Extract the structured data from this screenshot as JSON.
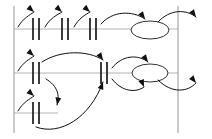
{
  "canvas": {
    "width": 212,
    "height": 139,
    "background": "#ffffff",
    "title": "process-flow-schematic"
  },
  "colors": {
    "rail": "#b4b4b4",
    "boundary": "#a0a0a0",
    "gate": "#1a1a1a",
    "arrow": "#111111",
    "ellipse_stroke": "#333333",
    "ellipse_fill": "#ffffff"
  },
  "strokes": {
    "rail_width": 1.1,
    "boundary_width": 1.1,
    "gate_width": 1.7,
    "arrow_width": 1.0,
    "ellipse_width": 1.0
  },
  "boundaries": [
    {
      "name": "left-boundary",
      "x": 14,
      "y1": 6,
      "y2": 133
    },
    {
      "name": "right-boundary",
      "x": 178,
      "y1": 6,
      "y2": 133
    }
  ],
  "rails": [
    {
      "name": "rail-top",
      "y": 29,
      "x1": 14,
      "x2": 178,
      "label": "row-1"
    },
    {
      "name": "rail-middle",
      "y": 73,
      "x1": 14,
      "x2": 178,
      "label": "row-2"
    },
    {
      "name": "rail-bottom",
      "y": 113,
      "x1": 14,
      "x2": 58,
      "label": "row-3"
    }
  ],
  "gates": [
    {
      "name": "gate-r1-a",
      "x": 33,
      "y": 29,
      "row": 1
    },
    {
      "name": "gate-r1-b",
      "x": 39,
      "y": 29,
      "row": 1
    },
    {
      "name": "gate-r1-c",
      "x": 62,
      "y": 29,
      "row": 1
    },
    {
      "name": "gate-r1-d",
      "x": 68,
      "y": 29,
      "row": 1
    },
    {
      "name": "gate-r1-e",
      "x": 90,
      "y": 29,
      "row": 1
    },
    {
      "name": "gate-r1-f",
      "x": 96,
      "y": 29,
      "row": 1
    },
    {
      "name": "gate-r2-a",
      "x": 33,
      "y": 73,
      "row": 2
    },
    {
      "name": "gate-r2-b",
      "x": 39,
      "y": 73,
      "row": 2
    },
    {
      "name": "gate-r2-c",
      "x": 101,
      "y": 73,
      "row": 2
    },
    {
      "name": "gate-r2-d",
      "x": 107,
      "y": 73,
      "row": 2
    },
    {
      "name": "gate-r3-a",
      "x": 33,
      "y": 113,
      "row": 3
    },
    {
      "name": "gate-r3-b",
      "x": 39,
      "y": 113,
      "row": 3
    }
  ],
  "gate_half_height": 11,
  "nodes": [
    {
      "name": "node-ellipse-top",
      "cx": 150,
      "cy": 30,
      "rx": 19,
      "ry": 9,
      "row": 1
    },
    {
      "name": "node-ellipse-middle",
      "cx": 150,
      "cy": 73,
      "rx": 18,
      "ry": 9,
      "row": 2
    }
  ],
  "arrows": [
    {
      "name": "arc-r1-1",
      "path": "M 18 27 C 23 18, 30 15, 34 12",
      "head": [
        34,
        12,
        0.72
      ]
    },
    {
      "name": "arc-r1-2",
      "path": "M 45 27 C 50 18, 57 15, 62 12",
      "head": [
        62,
        12,
        0.72
      ]
    },
    {
      "name": "arc-r1-3",
      "path": "M 74 27 C 79 18, 85 15, 90 12",
      "head": [
        90,
        12,
        0.72
      ]
    },
    {
      "name": "arc-r1-4",
      "path": "M 101 24 C 112 11, 132 10, 145 19",
      "head": [
        145,
        19,
        0.95
      ]
    },
    {
      "name": "arc-r1-5",
      "path": "M 158 22 C 170 9, 186 9, 196 17",
      "head": [
        196,
        17,
        0.95
      ]
    },
    {
      "name": "arc-r2-1",
      "path": "M 18 71 C 23 62, 30 59, 34 56",
      "head": [
        34,
        56,
        0.72
      ]
    },
    {
      "name": "arc-r2-2",
      "path": "M 42 62 C 60 50, 88 50, 103 60",
      "head": [
        103,
        60,
        0.98
      ]
    },
    {
      "name": "arc-r2-3",
      "path": "M 112 68 C 122 55, 138 54, 148 62",
      "head": [
        148,
        62,
        0.95
      ]
    },
    {
      "name": "arc-r2-4",
      "path": "M 112 79 C 122 92, 136 93, 144 87",
      "head": [
        144,
        87,
        1.18
      ]
    },
    {
      "name": "arc-r2-5",
      "path": "M 158 80 C 172 94, 188 92, 196 83",
      "head": [
        196,
        83,
        0.9
      ]
    },
    {
      "name": "arc-r3-1",
      "path": "M 18 111 C 23 102, 30 99, 34 96",
      "head": [
        34,
        96,
        0.72
      ]
    },
    {
      "name": "arc-down-r2-r3",
      "path": "M 46 79 C 58 86, 60 96, 57 105",
      "head": [
        57,
        105,
        1.75
      ]
    },
    {
      "name": "arc-long-up",
      "path": "M 36 127 C 60 136, 90 118, 103 82",
      "head": [
        103,
        82,
        5.05
      ]
    }
  ],
  "meta": {
    "row_count": 3,
    "gate_pair_count": 6,
    "node_count": 2,
    "arrow_count": 13
  }
}
